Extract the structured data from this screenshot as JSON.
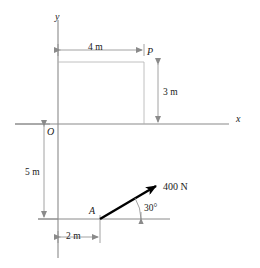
{
  "figure": {
    "type": "statics-free-body-diagram",
    "axes": {
      "x_label": "x",
      "y_label": "y",
      "origin_label": "O"
    },
    "points": [
      {
        "name": "P",
        "label": "P",
        "x_m": 4,
        "y_m": 3
      },
      {
        "name": "A",
        "label": "A",
        "x_m": 2,
        "y_m": -5
      },
      {
        "name": "O",
        "label": "O",
        "x_m": 0,
        "y_m": 0
      }
    ],
    "dimensions": [
      {
        "name": "horizontal-4m",
        "label": "4 m",
        "value": 4,
        "unit": "m",
        "orientation": "horizontal"
      },
      {
        "name": "vertical-3m",
        "label": "3 m",
        "value": 3,
        "unit": "m",
        "orientation": "vertical"
      },
      {
        "name": "vertical-5m",
        "label": "5 m",
        "value": 5,
        "unit": "m",
        "orientation": "vertical"
      },
      {
        "name": "horizontal-2m",
        "label": "2 m",
        "value": 2,
        "unit": "m",
        "orientation": "horizontal"
      }
    ],
    "force": {
      "magnitude_label": "400 N",
      "magnitude": 400,
      "unit": "N",
      "angle_label": "30°",
      "angle_deg": 30,
      "applied_at": "A",
      "direction": "up-and-to-the-right"
    },
    "colors": {
      "line": "#8a8a8a",
      "force": "#000000",
      "text": "#1a1a1a",
      "background": "#ffffff"
    }
  }
}
